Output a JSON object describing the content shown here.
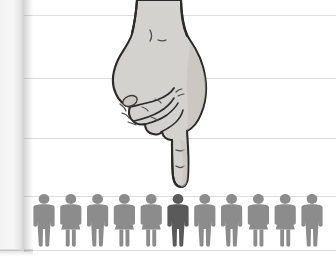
{
  "illustration": {
    "title": "Hand pointing down at a row of people icons",
    "alt_description": "A hand-drawn hand with index finger extended points downward at one highlighted person in a row of eleven people pictograms",
    "background_color": "#ffffff"
  },
  "canvas": {
    "width": 336,
    "height": 262
  },
  "left_panel": {
    "name": "left-edge-panel",
    "x": 0,
    "y": 0,
    "width": 24,
    "height": 249,
    "color": "#f4f4f4",
    "edge_color": "#cfcfcf"
  },
  "ruled_lines": {
    "color": "#dcdcdc",
    "y_positions": [
      15,
      78,
      138,
      196,
      250
    ]
  },
  "hand": {
    "name": "pointing-hand",
    "fill_color": "#d4d2cf",
    "outline_color": "#2b2b2b",
    "shade_color": "#bdbab6",
    "pointing_direction": "down",
    "fingertip_x": 173,
    "fingertip_y": 186,
    "wrist_top_y": 0
  },
  "people_row": {
    "name": "people-pictogram-row",
    "count": 11,
    "baseline_y": 246,
    "head_y": 199,
    "first_x": 44,
    "spacing": 26.8,
    "default_color": "#8c8c8c",
    "highlight_color": "#5a5a5a",
    "highlighted_index": 6,
    "figures": [
      {
        "index": 1,
        "gender": "male",
        "highlighted": false,
        "color": "#8c8c8c"
      },
      {
        "index": 2,
        "gender": "female",
        "highlighted": false,
        "color": "#8c8c8c"
      },
      {
        "index": 3,
        "gender": "male",
        "highlighted": false,
        "color": "#8c8c8c"
      },
      {
        "index": 4,
        "gender": "female",
        "highlighted": false,
        "color": "#8c8c8c"
      },
      {
        "index": 5,
        "gender": "female",
        "highlighted": false,
        "color": "#8c8c8c"
      },
      {
        "index": 6,
        "gender": "male",
        "highlighted": true,
        "color": "#5a5a5a"
      },
      {
        "index": 7,
        "gender": "male",
        "highlighted": false,
        "color": "#8c8c8c"
      },
      {
        "index": 8,
        "gender": "male",
        "highlighted": false,
        "color": "#8c8c8c"
      },
      {
        "index": 9,
        "gender": "female",
        "highlighted": false,
        "color": "#8c8c8c"
      },
      {
        "index": 10,
        "gender": "female",
        "highlighted": false,
        "color": "#8c8c8c"
      },
      {
        "index": 11,
        "gender": "male",
        "highlighted": false,
        "color": "#8c8c8c"
      }
    ]
  }
}
